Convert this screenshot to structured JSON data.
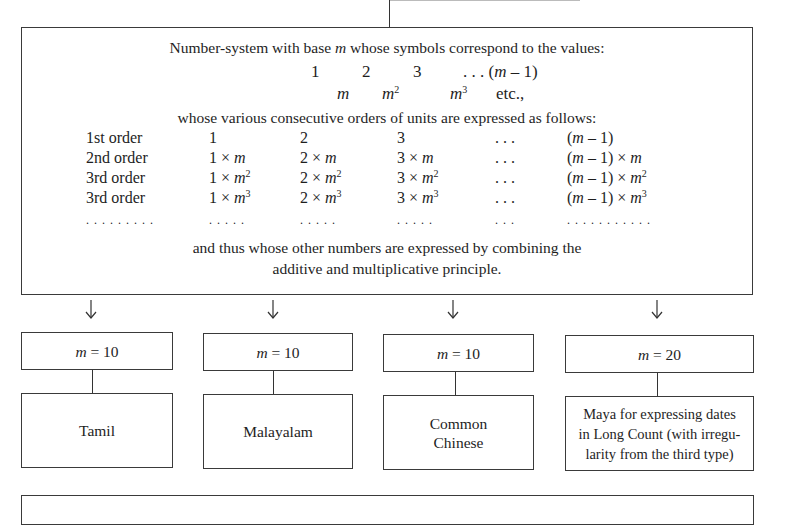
{
  "diagram": {
    "main_box": {
      "line1_pre": "Number-system with base ",
      "line1_var": "m",
      "line1_post": " whose symbols correspond to the values:",
      "values_row": [
        "1",
        "2",
        "3",
        ". . . (m – 1)"
      ],
      "powers_row": {
        "m": "m",
        "m2_base": "m",
        "m2_exp": "2",
        "m3_base": "m",
        "m3_exp": "3",
        "etc": "etc.,"
      },
      "orders_intro": "whose various consecutive orders of units are expressed as follows:",
      "orders_table": {
        "rows": [
          {
            "label": "1st order",
            "c1": "1",
            "c2": "2",
            "c3": "3",
            "c4": ". . .",
            "c5": "(m – 1)"
          },
          {
            "label": "2nd order",
            "c1": "1 × m",
            "c2": "2 × m",
            "c3": "3 × m",
            "c4": ". . .",
            "c5": "(m – 1) × m"
          },
          {
            "label": "3rd order",
            "c1": "1 × m",
            "c1_exp": "2",
            "c2": "2 × m",
            "c2_exp": "2",
            "c3": "3 × m",
            "c3_exp": "2",
            "c4": ". . .",
            "c5": "(m – 1) × m",
            "c5_exp": "2"
          },
          {
            "label": "3rd order",
            "c1": "1 × m",
            "c1_exp": "3",
            "c2": "2 × m",
            "c2_exp": "3",
            "c3": "3 × m",
            "c3_exp": "3",
            "c4": ". . .",
            "c5": "(m – 1) × m",
            "c5_exp": "3"
          },
          {
            "label": ". . . . . . . . .",
            "c1": ". . . . .",
            "c2": ". . . . .",
            "c3": ". . . . .",
            "c4": ". . .",
            "c5": ". . . . . . . . . . ."
          }
        ]
      },
      "closing_line1": "and thus whose other numbers are expressed by combining the",
      "closing_line2": "additive and multiplicative principle."
    },
    "branches": [
      {
        "base_label": "m = 10",
        "system": "Tamil"
      },
      {
        "base_label": "m = 10",
        "system": "Malayalam"
      },
      {
        "base_label": "m = 10",
        "system": "Common Chinese"
      },
      {
        "base_label": "m = 20",
        "system": "Maya for expressing dates in Long Count (with irregu-larity from the third type)"
      }
    ],
    "branch_display": {
      "b0_base_var": "m",
      "b0_base_val": " = 10",
      "b0_line1": "Tamil",
      "b1_base_var": "m",
      "b1_base_val": " = 10",
      "b1_line1": "Malayalam",
      "b2_base_var": "m",
      "b2_base_val": " = 10",
      "b2_line1": "Common",
      "b2_line2": "Chinese",
      "b3_base_var": "m",
      "b3_base_val": " = 20",
      "b3_line1": "Maya for expressing dates",
      "b3_line2": "in Long Count (with irregu-",
      "b3_line3": "larity from the third type)"
    }
  }
}
